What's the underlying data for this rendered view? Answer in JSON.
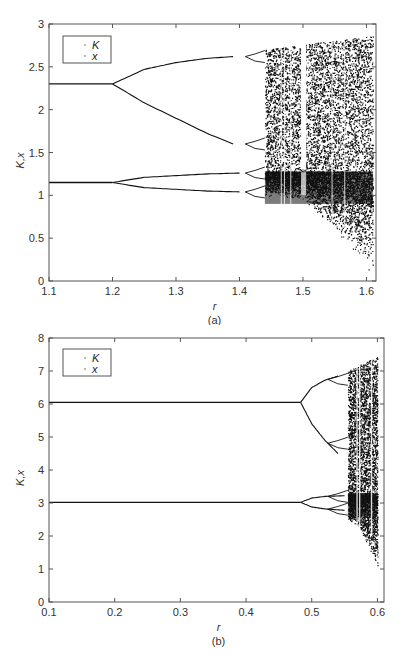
{
  "chart_data": [
    {
      "id": "a",
      "type": "scatter",
      "subtype": "bifurcation-diagram",
      "caption": "(a)",
      "title": "",
      "xlabel": "r",
      "ylabel": "K,x",
      "xlim": [
        1.1,
        1.615
      ],
      "ylim": [
        0,
        3
      ],
      "xticks": [
        1.1,
        1.2,
        1.3,
        1.4,
        1.5,
        1.6
      ],
      "xtick_labels": [
        "1.1",
        "1.2",
        "1.3",
        "1.4",
        "1.5",
        "1.6"
      ],
      "yticks": [
        0,
        0.5,
        1,
        1.5,
        2,
        2.5,
        3
      ],
      "ytick_labels": [
        "0",
        "0.5",
        "1",
        "1.5",
        "2",
        "2.5",
        "3"
      ],
      "grid": false,
      "legend": {
        "position": "upper-left",
        "entries": [
          "K",
          "x"
        ]
      },
      "series": [
        {
          "name": "K",
          "fixed_point": {
            "r_range": [
              1.1,
              1.2
            ],
            "value": 2.3
          },
          "period2_upper": {
            "r": [
              1.2,
              1.25,
              1.3,
              1.35,
              1.39
            ],
            "values": [
              2.3,
              2.47,
              2.55,
              2.6,
              2.62
            ]
          },
          "period2_lower": {
            "r": [
              1.2,
              1.25,
              1.3,
              1.35,
              1.39
            ],
            "values": [
              2.3,
              2.08,
              1.9,
              1.72,
              1.6
            ]
          },
          "period4_onset_r": 1.39,
          "chaos_onset_r": 1.44,
          "chaos_band": {
            "r": [
              1.44,
              1.5,
              1.55,
              1.6,
              1.61
            ],
            "top": [
              2.7,
              2.76,
              2.81,
              2.85,
              2.86
            ],
            "bottom": [
              1.2,
              1.1,
              1.0,
              0.9,
              0.85
            ]
          },
          "periodic_window_r": 1.5
        },
        {
          "name": "x",
          "fixed_point": {
            "r_range": [
              1.1,
              1.2
            ],
            "value": 1.15
          },
          "period2_upper": {
            "r": [
              1.2,
              1.25,
              1.3,
              1.35,
              1.4
            ],
            "values": [
              1.15,
              1.21,
              1.23,
              1.25,
              1.26
            ]
          },
          "period2_lower": {
            "r": [
              1.2,
              1.25,
              1.3,
              1.35,
              1.4
            ],
            "values": [
              1.15,
              1.09,
              1.07,
              1.05,
              1.04
            ]
          },
          "chaos_onset_r": 1.44,
          "chaos_band": {
            "r": [
              1.44,
              1.5,
              1.55,
              1.6,
              1.61
            ],
            "top": [
              1.28,
              1.28,
              1.28,
              1.28,
              1.28
            ],
            "bottom": [
              1.0,
              0.95,
              0.6,
              0.15,
              0.05
            ]
          }
        }
      ]
    },
    {
      "id": "b",
      "type": "scatter",
      "subtype": "bifurcation-diagram",
      "caption": "(b)",
      "title": "",
      "xlabel": "r",
      "ylabel": "K,x",
      "xlim": [
        0.1,
        0.61
      ],
      "ylim": [
        0,
        8
      ],
      "xticks": [
        0.1,
        0.2,
        0.3,
        0.4,
        0.5,
        0.6
      ],
      "xtick_labels": [
        "0.1",
        "0.2",
        "0.3",
        "0.4",
        "0.5",
        "0.6"
      ],
      "yticks": [
        0,
        1,
        2,
        3,
        4,
        5,
        6,
        7,
        8
      ],
      "ytick_labels": [
        "0",
        "1",
        "2",
        "3",
        "4",
        "5",
        "6",
        "7",
        "8"
      ],
      "grid": false,
      "legend": {
        "position": "upper-left",
        "entries": [
          "K",
          "x"
        ]
      },
      "series": [
        {
          "name": "K",
          "fixed_point": {
            "r_range": [
              0.1,
              0.483
            ],
            "value": 6.05
          },
          "period2_upper": {
            "r": [
              0.483,
              0.5,
              0.52,
              0.54
            ],
            "values": [
              6.05,
              6.5,
              6.72,
              6.85
            ]
          },
          "period2_lower": {
            "r": [
              0.483,
              0.5,
              0.52,
              0.54
            ],
            "values": [
              6.05,
              5.4,
              4.9,
              4.5
            ]
          },
          "chaos_onset_r": 0.555,
          "chaos_band": {
            "r": [
              0.555,
              0.57,
              0.585,
              0.6
            ],
            "top": [
              7.0,
              7.15,
              7.3,
              7.45
            ],
            "bottom": [
              3.2,
              3.1,
              3.0,
              2.9
            ]
          }
        },
        {
          "name": "x",
          "fixed_point": {
            "r_range": [
              0.1,
              0.483
            ],
            "value": 3.02
          },
          "period2_upper": {
            "r": [
              0.483,
              0.5,
              0.52,
              0.55
            ],
            "values": [
              3.02,
              3.15,
              3.2,
              3.22
            ]
          },
          "period2_lower": {
            "r": [
              0.483,
              0.5,
              0.52,
              0.55
            ],
            "values": [
              3.02,
              2.88,
              2.82,
              2.78
            ]
          },
          "chaos_onset_r": 0.555,
          "chaos_band": {
            "r": [
              0.555,
              0.57,
              0.585,
              0.6
            ],
            "top": [
              3.3,
              3.3,
              3.3,
              3.3
            ],
            "bottom": [
              2.5,
              2.3,
              1.7,
              0.95
            ]
          }
        }
      ]
    }
  ],
  "figure": {
    "panel_a": {
      "caption": "(a)",
      "xlabel": "r",
      "ylabel": "K,x",
      "legend": [
        "K",
        "x"
      ]
    },
    "panel_b": {
      "caption": "(b)",
      "xlabel": "r",
      "ylabel": "K,x",
      "legend": [
        "K",
        "x"
      ]
    }
  },
  "colors": {
    "ink": "#111111",
    "axis": "#555555",
    "background": "#ffffff"
  }
}
